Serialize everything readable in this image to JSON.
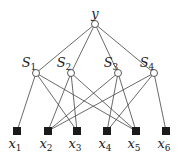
{
  "diagram": {
    "root": {
      "id": "y",
      "label": "y",
      "x": 95,
      "y": 24
    },
    "hidden": [
      {
        "id": "S1",
        "label": "S",
        "sub": "1",
        "x": 36,
        "y": 73
      },
      {
        "id": "S2",
        "label": "S",
        "sub": "2",
        "x": 71,
        "y": 73
      },
      {
        "id": "S3",
        "label": "S",
        "sub": "3",
        "x": 118,
        "y": 73
      },
      {
        "id": "S4",
        "label": "S",
        "sub": "4",
        "x": 154,
        "y": 73
      }
    ],
    "leaves": [
      {
        "id": "x1",
        "label": "x",
        "sub": "1",
        "x": 17,
        "y": 131
      },
      {
        "id": "x2",
        "label": "x",
        "sub": "2",
        "x": 48,
        "y": 131
      },
      {
        "id": "x3",
        "label": "x",
        "sub": "3",
        "x": 77,
        "y": 131
      },
      {
        "id": "x4",
        "label": "x",
        "sub": "4",
        "x": 107,
        "y": 131
      },
      {
        "id": "x5",
        "label": "x",
        "sub": "5",
        "x": 136,
        "y": 131
      },
      {
        "id": "x6",
        "label": "x",
        "sub": "6",
        "x": 166,
        "y": 131
      }
    ],
    "edges": [
      [
        "y",
        "S1"
      ],
      [
        "y",
        "S2"
      ],
      [
        "y",
        "S3"
      ],
      [
        "y",
        "S4"
      ],
      [
        "S1",
        "x1"
      ],
      [
        "S1",
        "x3"
      ],
      [
        "S1",
        "x5"
      ],
      [
        "S2",
        "x2"
      ],
      [
        "S2",
        "x3"
      ],
      [
        "S2",
        "x5"
      ],
      [
        "S3",
        "x2"
      ],
      [
        "S3",
        "x4"
      ],
      [
        "S3",
        "x5"
      ],
      [
        "S4",
        "x2"
      ],
      [
        "S4",
        "x4"
      ],
      [
        "S4",
        "x6"
      ]
    ]
  }
}
